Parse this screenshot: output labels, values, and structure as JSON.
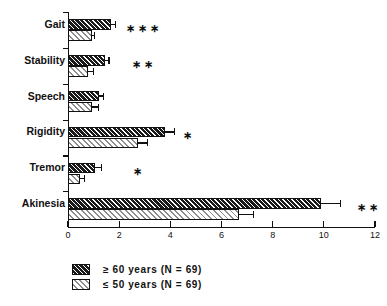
{
  "chart_data": {
    "type": "bar",
    "orientation": "horizontal",
    "title": "",
    "xlabel": "",
    "ylabel": "",
    "xlim": [
      0,
      12
    ],
    "xticks": [
      0,
      2,
      4,
      6,
      8,
      10,
      12
    ],
    "xticklabels": [
      "0",
      "2",
      "4",
      "6",
      "8",
      "10",
      "12"
    ],
    "grid": false,
    "legend_position": "bottom-left",
    "categories": [
      "Gait",
      "Stability",
      "Speech",
      "Rigidity",
      "Tremor",
      "Akinesia"
    ],
    "series": [
      {
        "name": "≥ 60 years (N = 69)",
        "key": "older",
        "values": [
          1.7,
          1.45,
          1.2,
          3.8,
          1.05,
          9.9
        ],
        "errors": [
          0.15,
          0.15,
          0.2,
          0.35,
          0.25,
          0.75
        ]
      },
      {
        "name": "≤ 50 years (N = 69)",
        "key": "younger",
        "values": [
          0.95,
          0.8,
          0.95,
          2.75,
          0.45,
          6.7
        ],
        "errors": [
          0.1,
          0.2,
          0.25,
          0.35,
          0.2,
          0.55
        ]
      }
    ],
    "annotations": [
      {
        "category": "Gait",
        "marker": "∗∗∗",
        "x": 2.25
      },
      {
        "category": "Stability",
        "marker": "∗∗",
        "x": 2.5
      },
      {
        "category": "Speech",
        "marker": "",
        "x": 0
      },
      {
        "category": "Rigidity",
        "marker": "∗",
        "x": 4.5
      },
      {
        "category": "Tremor",
        "marker": "∗",
        "x": 2.55
      },
      {
        "category": "Akinesia",
        "marker": "∗∗",
        "x": 11.3
      }
    ]
  },
  "legend": {
    "items": [
      {
        "label": "≥  60  years  (N  =  69)",
        "swatch": "dark-hatch-swatch"
      },
      {
        "label": "≤  50  years  (N  =  69)",
        "swatch": "light-hatch-swatch"
      }
    ]
  },
  "colors": {
    "axis": "#111111",
    "dark_series": "#1a1a1a",
    "light_series": "#8d8d8d",
    "background": "#ffffff"
  }
}
